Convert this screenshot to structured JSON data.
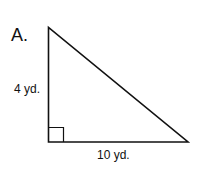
{
  "problem": {
    "label": "A.",
    "shape": "right-triangle",
    "sides": {
      "vertical": "4 yd.",
      "horizontal": "10 yd."
    },
    "right_angle_marker": true,
    "colors": {
      "stroke": "#111111",
      "background": "#ffffff"
    }
  }
}
